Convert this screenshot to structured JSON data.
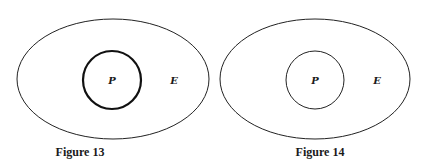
{
  "figures": [
    {
      "caption": "Figure 13",
      "outer_label": "E",
      "inner_label": "P",
      "inner_stroke": "bold",
      "outer": {
        "cx": 113,
        "cy": 79,
        "rx": 96,
        "ry": 60
      },
      "inner": {
        "cx": 112,
        "cy": 80,
        "r": 29
      }
    },
    {
      "caption": "Figure 14",
      "outer_label": "E",
      "inner_label": "P",
      "inner_stroke": "thin",
      "outer": {
        "cx": 315,
        "cy": 79,
        "rx": 95,
        "ry": 60
      },
      "inner": {
        "cx": 315,
        "cy": 80,
        "r": 29
      }
    }
  ]
}
